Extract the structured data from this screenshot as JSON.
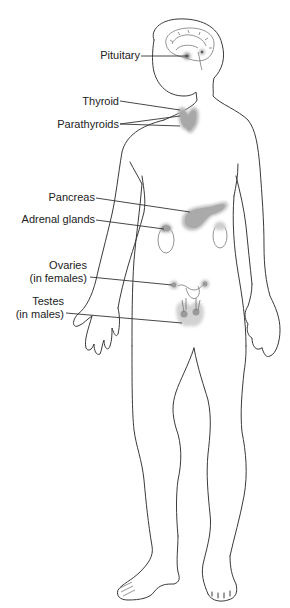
{
  "diagram": {
    "colors": {
      "outline": "#3a3a3a",
      "gland_fill": "#b8b8b8",
      "text": "#222222",
      "background": "#ffffff"
    },
    "labels": [
      {
        "id": "pituitary",
        "text": "Pituitary"
      },
      {
        "id": "thyroid",
        "text": "Thyroid"
      },
      {
        "id": "parathyroids",
        "text": "Parathyroids"
      },
      {
        "id": "pancreas",
        "text": "Pancreas"
      },
      {
        "id": "adrenal",
        "text": "Adrenal glands"
      },
      {
        "id": "ovaries",
        "line1": "Ovaries",
        "line2": "(in females)"
      },
      {
        "id": "testes",
        "line1": "Testes",
        "line2": "(in males)"
      }
    ]
  }
}
